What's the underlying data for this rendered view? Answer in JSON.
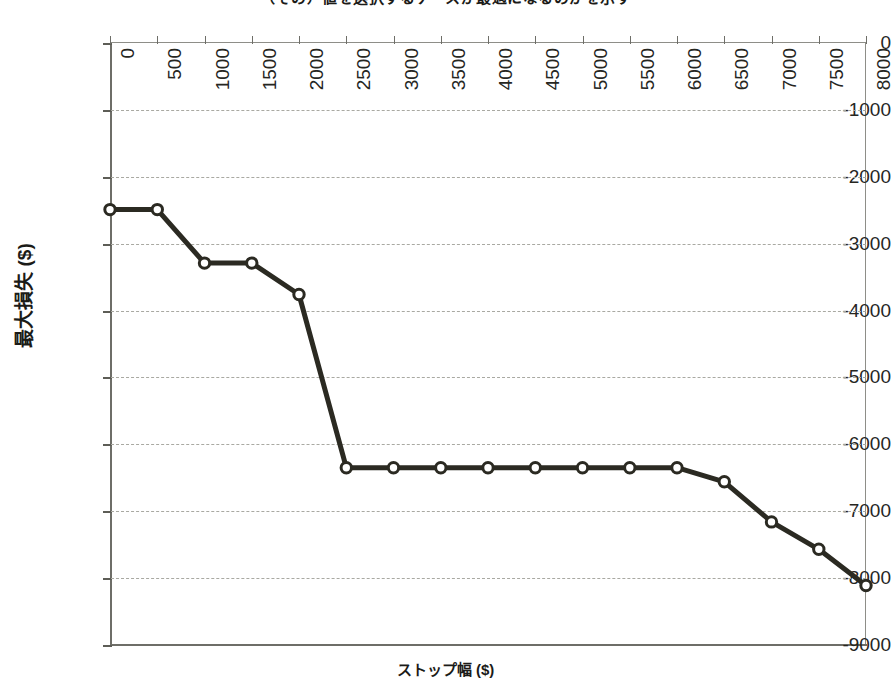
{
  "chart_data": {
    "type": "line",
    "title": "（その）値を選択するケースが最適になるのかを示す",
    "xlabel": "ストップ幅 ($)",
    "ylabel": "最大損失 ($)",
    "xlim": [
      0,
      8000
    ],
    "ylim": [
      -9000,
      0
    ],
    "grid": true,
    "legend": "none",
    "series_color": "#2b2a22",
    "marker": "open-circle",
    "x_ticks": [
      "0",
      "500",
      "1000",
      "1500",
      "2000",
      "2500",
      "3000",
      "3500",
      "4000",
      "4500",
      "5000",
      "5500",
      "6000",
      "6500",
      "7000",
      "7500",
      "8000"
    ],
    "y_ticks": [
      "0",
      "-1000",
      "-2000",
      "-3000",
      "-4000",
      "-5000",
      "-6000",
      "-7000",
      "-8000",
      "-9000"
    ],
    "x": [
      0,
      500,
      1000,
      1500,
      2000,
      2500,
      3000,
      3500,
      4000,
      4500,
      5000,
      5500,
      6000,
      6500,
      7000,
      7500,
      8000
    ],
    "values": [
      -2490,
      -2490,
      -3290,
      -3290,
      -3760,
      -6350,
      -6350,
      -6350,
      -6350,
      -6350,
      -6350,
      -6350,
      -6350,
      -6560,
      -7160,
      -7570,
      -8110
    ],
    "series": [
      {
        "name": "最大損失",
        "values": [
          -2490,
          -2490,
          -3290,
          -3290,
          -3760,
          -6350,
          -6350,
          -6350,
          -6350,
          -6350,
          -6350,
          -6350,
          -6350,
          -6560,
          -7160,
          -7570,
          -8110
        ]
      }
    ]
  },
  "axes": {
    "y_title": "最大損失 ($)",
    "x_title": "ストップ幅 ($)"
  },
  "title": {
    "text": "（その）値を選択するケースが最適になるのかを示す"
  }
}
